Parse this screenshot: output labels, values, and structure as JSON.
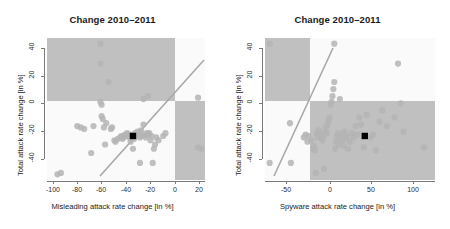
{
  "figure": {
    "width": 450,
    "height": 229,
    "background": "#ffffff",
    "point_color": "#b4b4b4",
    "shade_color": "#c0c0c0",
    "panel_bg": "#fafafa",
    "reference_line_color": "#a8a8a8",
    "mean_marker_color": "#000000"
  },
  "chart_data": [
    {
      "type": "scatter",
      "title": "Change 2010–2011",
      "xlabel": "Misleading attack rate change [in %]",
      "ylabel": "Total attack rate change [in %]",
      "xlim": [
        -108,
        28
      ],
      "ylim": [
        -52,
        48
      ],
      "xticks": [
        -100,
        -80,
        -60,
        -40,
        -20,
        0,
        20
      ],
      "yticks": [
        40,
        20,
        0,
        -20,
        -40
      ],
      "grid": false,
      "legend": "none",
      "annotations": [
        {
          "name": "shaded-quadrant-upper-left",
          "x0": -108,
          "y0": 0,
          "x1": 0,
          "y1": 48
        },
        {
          "name": "shaded-quadrant-lower-right",
          "x0": 0,
          "y0": -52,
          "x1": 28,
          "y1": 0
        },
        {
          "name": "reference-line-identity",
          "x0": -64,
          "y0": -64,
          "x1": 28,
          "y1": 28
        }
      ],
      "mean_marker": {
        "x": -34,
        "y": -21
      },
      "points": [
        [
          -99,
          -48
        ],
        [
          -96,
          -47
        ],
        [
          -82,
          -14
        ],
        [
          -79,
          -15
        ],
        [
          -76,
          -16
        ],
        [
          -70,
          -33
        ],
        [
          -68,
          -14
        ],
        [
          -62,
          44
        ],
        [
          -62,
          30
        ],
        [
          -62,
          3
        ],
        [
          -61,
          1
        ],
        [
          -61,
          -7
        ],
        [
          -60,
          -9
        ],
        [
          -59,
          -15
        ],
        [
          -58,
          -27
        ],
        [
          -57,
          -12
        ],
        [
          -55,
          17
        ],
        [
          -53,
          -16
        ],
        [
          -52,
          -15
        ],
        [
          -50,
          -24
        ],
        [
          -49,
          -25
        ],
        [
          -47,
          -23
        ],
        [
          -45,
          -22
        ],
        [
          -44,
          -21
        ],
        [
          -43,
          -23
        ],
        [
          -42,
          -22
        ],
        [
          -41,
          -20
        ],
        [
          -40,
          -21
        ],
        [
          -39,
          -19
        ],
        [
          -38,
          -20
        ],
        [
          -37,
          -22
        ],
        [
          -36,
          -25
        ],
        [
          -35,
          -20
        ],
        [
          -34,
          -30
        ],
        [
          -33,
          -23
        ],
        [
          -32,
          -19
        ],
        [
          -31,
          -21
        ],
        [
          -30,
          -18
        ],
        [
          -29,
          -20
        ],
        [
          -28,
          -22
        ],
        [
          -28,
          -40
        ],
        [
          -27,
          -17
        ],
        [
          -26,
          -21
        ],
        [
          -25,
          5
        ],
        [
          -25,
          -13
        ],
        [
          -24,
          -20
        ],
        [
          -23,
          -22
        ],
        [
          -22,
          -19
        ],
        [
          -21,
          7
        ],
        [
          -21,
          -20
        ],
        [
          -20,
          -19
        ],
        [
          -19,
          -24
        ],
        [
          -18,
          -21
        ],
        [
          -17,
          -40
        ],
        [
          -16,
          -30
        ],
        [
          -15,
          -27
        ],
        [
          -14,
          -22
        ],
        [
          -12,
          -24
        ],
        [
          -8,
          -21
        ],
        [
          -6,
          -19
        ],
        [
          22,
          6
        ],
        [
          22,
          -29
        ],
        [
          25,
          -30
        ]
      ]
    },
    {
      "type": "scatter",
      "title": "Change 2010–2011",
      "xlabel": "Spyware attack rate change [in %]",
      "ylabel": "Total attack rate change [in %]",
      "xlim": [
        -72,
        112
      ],
      "ylim": [
        -52,
        48
      ],
      "xticks": [
        -50,
        0,
        50,
        100
      ],
      "yticks": [
        40,
        20,
        0,
        -20,
        -40
      ],
      "grid": false,
      "legend": "none",
      "annotations": [
        {
          "name": "shaded-quadrant-upper-left",
          "x0": -72,
          "y0": 0,
          "x1": 0,
          "y1": 48
        },
        {
          "name": "shaded-quadrant-lower-right",
          "x0": 0,
          "y0": -52,
          "x1": 112,
          "y1": 0
        },
        {
          "name": "reference-line-identity",
          "x0": -60,
          "y0": -48,
          "x1": 25,
          "y1": 45
        }
      ],
      "mean_marker": {
        "x": 36,
        "y": -21
      },
      "points": [
        [
          -67,
          44
        ],
        [
          -67,
          -40
        ],
        [
          -45,
          -12
        ],
        [
          -44,
          -40
        ],
        [
          -30,
          -22
        ],
        [
          -28,
          -20
        ],
        [
          -26,
          -25
        ],
        [
          -25,
          -21
        ],
        [
          -22,
          -24
        ],
        [
          -20,
          -30
        ],
        [
          -19,
          -28
        ],
        [
          -18,
          -31
        ],
        [
          -17,
          -47
        ],
        [
          -16,
          -19
        ],
        [
          -15,
          -22
        ],
        [
          -14,
          -17
        ],
        [
          -12,
          -20
        ],
        [
          -11,
          -22
        ],
        [
          -10,
          -24
        ],
        [
          -9,
          -21
        ],
        [
          -8,
          -44
        ],
        [
          -7,
          -18
        ],
        [
          -6,
          -15
        ],
        [
          -5,
          -19
        ],
        [
          -4,
          -13
        ],
        [
          -3,
          -10
        ],
        [
          -2,
          -8
        ],
        [
          -1,
          1
        ],
        [
          0,
          3
        ],
        [
          1,
          7
        ],
        [
          2,
          12
        ],
        [
          3,
          17
        ],
        [
          3,
          44
        ],
        [
          4,
          -30
        ],
        [
          5,
          -25
        ],
        [
          6,
          -21
        ],
        [
          7,
          -19
        ],
        [
          8,
          -27
        ],
        [
          9,
          5
        ],
        [
          10,
          -22
        ],
        [
          11,
          -24
        ],
        [
          12,
          -20
        ],
        [
          13,
          -28
        ],
        [
          14,
          -18
        ],
        [
          15,
          -23
        ],
        [
          17,
          -21
        ],
        [
          18,
          -30
        ],
        [
          20,
          -25
        ],
        [
          22,
          -19
        ],
        [
          24,
          -22
        ],
        [
          26,
          -14
        ],
        [
          28,
          -20
        ],
        [
          30,
          -8
        ],
        [
          32,
          -13
        ],
        [
          35,
          -29
        ],
        [
          38,
          -6
        ],
        [
          42,
          -22
        ],
        [
          45,
          -20
        ],
        [
          48,
          -31
        ],
        [
          52,
          -11
        ],
        [
          55,
          -3
        ],
        [
          60,
          -14
        ],
        [
          68,
          -8
        ],
        [
          72,
          30
        ],
        [
          75,
          2
        ],
        [
          78,
          -18
        ],
        [
          100,
          -29
        ]
      ]
    }
  ]
}
